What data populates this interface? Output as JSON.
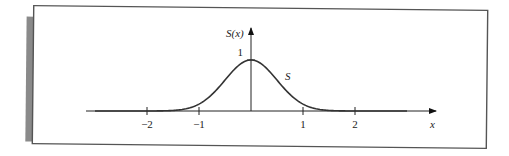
{
  "chart_data": {
    "type": "line",
    "title": "",
    "xlabel": "x",
    "ylabel": "S(x)",
    "curve_label": "S",
    "function": "S(x) = exp(-2 x^2)",
    "x_ticks": [
      -2,
      -1,
      1,
      2
    ],
    "x_tick_labels": [
      "−2",
      "−1",
      "1",
      "2"
    ],
    "y_ticks": [
      1
    ],
    "y_tick_labels": [
      "1"
    ],
    "xlim": [
      -3.2,
      3.6
    ],
    "ylim": [
      0,
      1.6
    ],
    "curve_domain": [
      -3.0,
      3.0
    ],
    "series": [
      {
        "name": "S",
        "x": [
          -3.0,
          -2.5,
          -2.0,
          -1.75,
          -1.5,
          -1.25,
          -1.0,
          -0.75,
          -0.5,
          -0.25,
          0,
          0.25,
          0.5,
          0.75,
          1.0,
          1.25,
          1.5,
          1.75,
          2.0,
          2.5,
          3.0
        ],
        "y": [
          0.0,
          0.0,
          0.0,
          0.002,
          0.011,
          0.044,
          0.135,
          0.325,
          0.607,
          0.882,
          1.0,
          0.882,
          0.607,
          0.325,
          0.135,
          0.044,
          0.011,
          0.002,
          0.0,
          0.0,
          0.0
        ]
      }
    ],
    "grid": false,
    "legend": "none"
  }
}
